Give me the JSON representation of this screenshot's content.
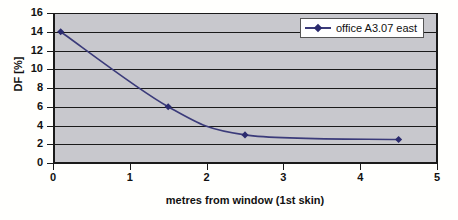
{
  "chart_data": {
    "type": "line",
    "title": "",
    "xlabel": "metres from window (1st skin)",
    "ylabel": "DF [%]",
    "xlim": [
      0,
      5
    ],
    "ylim": [
      0,
      16
    ],
    "xticks": [
      0,
      1,
      2,
      3,
      4,
      5
    ],
    "yticks": [
      0,
      2,
      4,
      6,
      8,
      10,
      12,
      14,
      16
    ],
    "grid": "horizontal",
    "legend_position": "top-right",
    "series": [
      {
        "name": "office A3.07 east",
        "color": "#3b3b7a",
        "marker": "diamond",
        "x": [
          0.1,
          1.5,
          2.5,
          4.5
        ],
        "values": [
          14.0,
          6.0,
          3.0,
          2.5
        ]
      }
    ]
  },
  "axes": {
    "y": {
      "label": "DF [%]",
      "ticks": [
        "0",
        "2",
        "4",
        "6",
        "8",
        "10",
        "12",
        "14",
        "16"
      ]
    },
    "x": {
      "label": "metres from window (1st skin)",
      "ticks": [
        "0",
        "1",
        "2",
        "3",
        "4",
        "5"
      ]
    }
  },
  "legend": {
    "entries": [
      {
        "label": "office A3.07 east"
      }
    ]
  },
  "colors": {
    "series": "#3b3b7a",
    "marker": "#2b2b6e",
    "plot_background": "#c8c8cd",
    "figure_background": "#fffffd",
    "gridline": "#1a1a1a",
    "text": "#111111"
  }
}
